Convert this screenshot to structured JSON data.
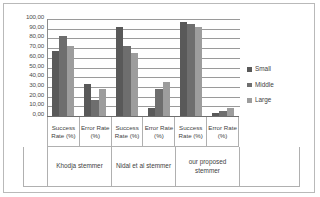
{
  "chart_data": {
    "type": "bar",
    "title": "",
    "subtitle": "",
    "xlabel": "",
    "ylabel": "",
    "ylim": [
      0,
      100
    ],
    "yticks": [
      "0,00",
      "10,00",
      "20,00",
      "30,00",
      "40,00",
      "50,00",
      "60,00",
      "70,00",
      "80,00",
      "90,00",
      "100,00"
    ],
    "ytick_values": [
      0,
      10,
      20,
      30,
      40,
      50,
      60,
      70,
      80,
      90,
      100
    ],
    "grid": true,
    "legend_position": "right",
    "legend": [
      "Small",
      "Middle",
      "Large"
    ],
    "series_colors": [
      "#595959",
      "#6e6e6e",
      "#9d9d9d"
    ],
    "groups": [
      "Khodja stemmer",
      "Nidal et al stemmer",
      "our proposed stemmer"
    ],
    "categories": [
      "Success Rate (%)",
      "Error Rate (%)",
      "Success Rate (%)",
      "Error Rate (%)",
      "Success Rate (%)",
      "Error Rate (%)"
    ],
    "series": [
      {
        "name": "Small",
        "values": [
          67.0,
          33.0,
          92.0,
          8.0,
          97.0,
          3.0
        ]
      },
      {
        "name": "Middle",
        "values": [
          83.0,
          17.0,
          72.0,
          28.0,
          95.0,
          5.0
        ]
      },
      {
        "name": "Large",
        "values": [
          72.0,
          28.0,
          65.0,
          35.0,
          92.0,
          8.0
        ]
      }
    ]
  }
}
